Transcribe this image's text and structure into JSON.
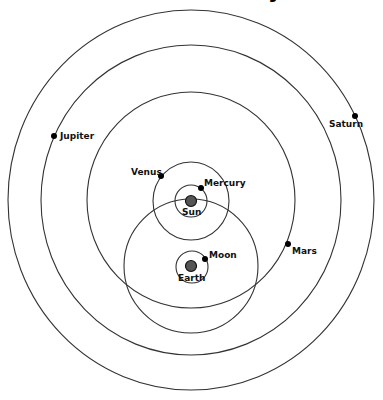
{
  "diagram": {
    "title_fragment": "y",
    "center_bodies": {
      "sun": {
        "label": "Sun",
        "cx": 191,
        "cy": 201,
        "r": 5.5
      },
      "earth": {
        "label": "Earth",
        "cx": 191,
        "cy": 266,
        "r": 5.5
      }
    },
    "orbits": [
      {
        "name": "saturn-orbit",
        "cx": 191,
        "cy": 200,
        "rx": 183,
        "ry": 190
      },
      {
        "name": "jupiter-orbit",
        "cx": 191,
        "cy": 200,
        "rx": 150,
        "ry": 155
      },
      {
        "name": "mars-orbit",
        "cx": 191,
        "cy": 200,
        "rx": 104,
        "ry": 108
      },
      {
        "name": "sun-orbit-around-earth",
        "cx": 191,
        "cy": 266,
        "rx": 67,
        "ry": 67
      },
      {
        "name": "venus-orbit",
        "cx": 191,
        "cy": 201,
        "rx": 38,
        "ry": 39
      },
      {
        "name": "mercury-orbit",
        "cx": 191,
        "cy": 201,
        "rx": 16,
        "ry": 16
      },
      {
        "name": "moon-orbit",
        "cx": 192,
        "cy": 267,
        "rx": 16,
        "ry": 16
      }
    ],
    "planets": {
      "jupiter": {
        "label": "Jupiter",
        "cx": 54,
        "cy": 136
      },
      "saturn": {
        "label": "Saturn",
        "cx": 355,
        "cy": 116
      },
      "venus": {
        "label": "Venus",
        "cx": 161,
        "cy": 176
      },
      "mercury": {
        "label": "Mercury",
        "cx": 201,
        "cy": 188
      },
      "mars": {
        "label": "Mars",
        "cx": 288,
        "cy": 244
      },
      "moon": {
        "label": "Moon",
        "cx": 205,
        "cy": 259
      }
    }
  }
}
